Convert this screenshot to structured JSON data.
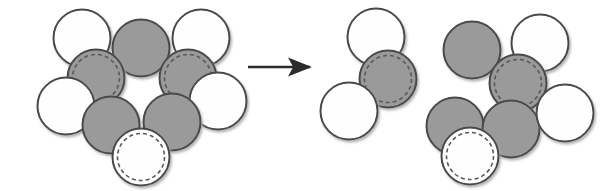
{
  "figure": {
    "title": "Hard-sphere cluster rearrangement",
    "caption": "",
    "width": 605,
    "height": 191,
    "background_color": "#ffffff"
  },
  "style": {
    "circle_diameter": 57,
    "gray_fill": "#9a9a9a",
    "white_fill": "#fefefe",
    "outline_color": "#4a4a4a",
    "outline_width": 2.0,
    "dashed_ring_color": "#5a5a5a",
    "dashed_ring_width": 1.6,
    "dashed_ring_inset": 5,
    "dash_pattern": "4 3",
    "shadow_color": "#b8b8b8"
  },
  "arrow": {
    "name": "reaction-arrow",
    "x1": 248,
    "y1": 67,
    "x2": 321,
    "y2": 67,
    "color": "#2b2b2b",
    "stroke_width": 2.4,
    "head_length": 11,
    "head_width": 9,
    "label": ""
  },
  "clusters": [
    {
      "id": "left-cluster",
      "label": "Initial configuration",
      "circles": [
        {
          "id": "L1",
          "name": "circle-white-top-left",
          "cx": 82,
          "cy": 38,
          "fill": "white",
          "dashed": false
        },
        {
          "id": "L2",
          "name": "circle-gray-top",
          "cx": 141,
          "cy": 48,
          "fill": "gray",
          "dashed": false
        },
        {
          "id": "L3",
          "name": "circle-white-top-right",
          "cx": 201,
          "cy": 38,
          "fill": "white",
          "dashed": false
        },
        {
          "id": "L4",
          "name": "circle-gray-dashed-left",
          "cx": 96,
          "cy": 78,
          "fill": "gray",
          "dashed": true
        },
        {
          "id": "L5",
          "name": "circle-gray-dashed-right",
          "cx": 188,
          "cy": 78,
          "fill": "gray",
          "dashed": true
        },
        {
          "id": "L6",
          "name": "circle-white-left",
          "cx": 66,
          "cy": 106,
          "fill": "white",
          "dashed": false
        },
        {
          "id": "L7",
          "name": "circle-white-right",
          "cx": 218,
          "cy": 101,
          "fill": "white",
          "dashed": false
        },
        {
          "id": "L8",
          "name": "circle-gray-bottom-left",
          "cx": 111,
          "cy": 125,
          "fill": "gray",
          "dashed": false
        },
        {
          "id": "L9",
          "name": "circle-gray-bottom-right",
          "cx": 172,
          "cy": 122,
          "fill": "gray",
          "dashed": false
        },
        {
          "id": "L10",
          "name": "circle-white-dashed-bottom",
          "cx": 141,
          "cy": 157,
          "fill": "white",
          "dashed": true
        }
      ]
    },
    {
      "id": "middle-cluster",
      "label": "Detached trimer",
      "circles": [
        {
          "id": "M1",
          "name": "circle-white-top",
          "cx": 376,
          "cy": 37,
          "fill": "white",
          "dashed": false
        },
        {
          "id": "M2",
          "name": "circle-gray-dashed-center",
          "cx": 388,
          "cy": 79,
          "fill": "gray",
          "dashed": true
        },
        {
          "id": "M3",
          "name": "circle-white-bottom-left",
          "cx": 349,
          "cy": 111,
          "fill": "white",
          "dashed": false
        }
      ]
    },
    {
      "id": "right-cluster",
      "label": "Final configuration",
      "circles": [
        {
          "id": "R1",
          "name": "circle-gray-top-left",
          "cx": 472,
          "cy": 50,
          "fill": "gray",
          "dashed": false
        },
        {
          "id": "R2",
          "name": "circle-white-top-right",
          "cx": 540,
          "cy": 43,
          "fill": "white",
          "dashed": false
        },
        {
          "id": "R3",
          "name": "circle-gray-dashed-center",
          "cx": 518,
          "cy": 83,
          "fill": "gray",
          "dashed": true
        },
        {
          "id": "R4",
          "name": "circle-gray-bottom-left",
          "cx": 455,
          "cy": 126,
          "fill": "gray",
          "dashed": false
        },
        {
          "id": "R5",
          "name": "circle-gray-bottom-center",
          "cx": 511,
          "cy": 129,
          "fill": "gray",
          "dashed": false
        },
        {
          "id": "R6",
          "name": "circle-white-right",
          "cx": 565,
          "cy": 113,
          "fill": "white",
          "dashed": false
        },
        {
          "id": "R7",
          "name": "circle-white-dashed-bottom",
          "cx": 470,
          "cy": 156,
          "fill": "white",
          "dashed": true
        }
      ]
    }
  ]
}
